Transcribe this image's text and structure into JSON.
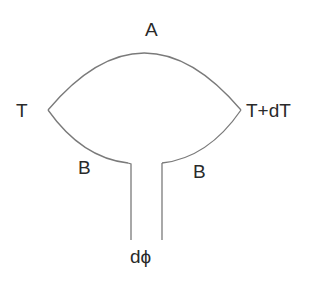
{
  "diagram": {
    "type": "tension-element-sketch",
    "stroke_color": "#7a7a7a",
    "text_color": "#2a2a2a",
    "background_color": "#ffffff",
    "labels": {
      "top": "A",
      "left": "T",
      "right": "T+dT",
      "lower_left": "B",
      "lower_right": "B",
      "bottom": "dϕ"
    }
  }
}
